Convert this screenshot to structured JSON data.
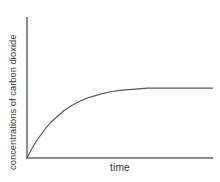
{
  "chart_data": {
    "type": "line",
    "title": "",
    "subtitle": "",
    "xlabel": "time",
    "ylabel": "concentrations of carbon dioxide",
    "x_tick_labels": [],
    "y_tick_labels": [],
    "grid": false,
    "legend": null,
    "legend_position": "none",
    "annotations": [],
    "xlim": [
      0,
      100
    ],
    "ylim": [
      0,
      100
    ],
    "axis_color": "#8d8d8d",
    "curve_color": "#585858",
    "text_color": "#333333",
    "background_color": "#ffffff",
    "series": [
      {
        "name": "carbon dioxide concentration",
        "x": [
          0,
          2,
          4,
          6,
          8,
          10,
          13,
          16,
          20,
          24,
          28,
          32,
          36,
          40,
          45,
          50,
          55,
          60,
          65,
          70,
          75,
          80,
          85,
          90,
          95,
          100
        ],
        "values": [
          0,
          10,
          19,
          27,
          34,
          41,
          50,
          57,
          66,
          73,
          78,
          83,
          86,
          89,
          92,
          94,
          95,
          96,
          97,
          97,
          97,
          97,
          97,
          97,
          97,
          97
        ]
      }
    ]
  },
  "figure": {
    "y_axis_label": "concentrations of carbon dioxide",
    "x_axis_label": "time"
  }
}
